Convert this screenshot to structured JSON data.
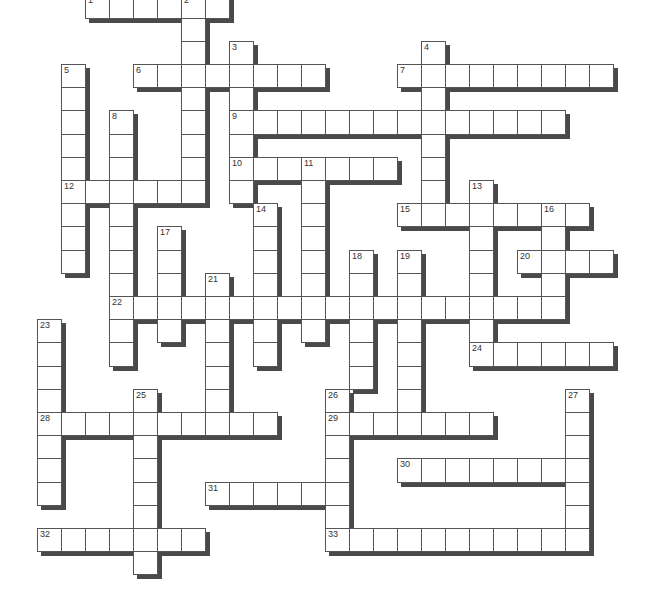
{
  "puzzle": {
    "type": "crossword",
    "layout": {
      "origin_x": 37,
      "origin_y": -5.6,
      "cell_w": 24,
      "cell_h": 23.2,
      "shadow_offset": 4
    },
    "colors": {
      "cell_bg": "#ffffff",
      "cell_border": "#555555",
      "shadow": "#4a4a4a",
      "number": "#333333"
    },
    "entries": [
      {
        "number": "1",
        "direction": "across",
        "row": 0,
        "col": 2,
        "length": 6
      },
      {
        "number": "2",
        "direction": "down",
        "row": 0,
        "col": 6,
        "length": 9
      },
      {
        "number": "3",
        "direction": "down",
        "row": 2,
        "col": 8,
        "length": 7
      },
      {
        "number": "4",
        "direction": "down",
        "row": 2,
        "col": 16,
        "length": 8
      },
      {
        "number": "5",
        "direction": "down",
        "row": 3,
        "col": 1,
        "length": 9
      },
      {
        "number": "6",
        "direction": "across",
        "row": 3,
        "col": 4,
        "length": 8
      },
      {
        "number": "7",
        "direction": "across",
        "row": 3,
        "col": 15,
        "length": 9
      },
      {
        "number": "8",
        "direction": "down",
        "row": 5,
        "col": 3,
        "length": 11
      },
      {
        "number": "9",
        "direction": "across",
        "row": 5,
        "col": 8,
        "length": 14
      },
      {
        "number": "10",
        "direction": "across",
        "row": 7,
        "col": 8,
        "length": 7
      },
      {
        "number": "11",
        "direction": "down",
        "row": 7,
        "col": 11,
        "length": 8
      },
      {
        "number": "12",
        "direction": "across",
        "row": 8,
        "col": 1,
        "length": 6
      },
      {
        "number": "13",
        "direction": "down",
        "row": 8,
        "col": 18,
        "length": 8
      },
      {
        "number": "14",
        "direction": "down",
        "row": 9,
        "col": 9,
        "length": 7
      },
      {
        "number": "15",
        "direction": "across",
        "row": 9,
        "col": 15,
        "length": 8
      },
      {
        "number": "16",
        "direction": "down",
        "row": 9,
        "col": 21,
        "length": 5
      },
      {
        "number": "17",
        "direction": "down",
        "row": 10,
        "col": 5,
        "length": 5
      },
      {
        "number": "18",
        "direction": "down",
        "row": 11,
        "col": 13,
        "length": 6
      },
      {
        "number": "19",
        "direction": "down",
        "row": 11,
        "col": 15,
        "length": 8
      },
      {
        "number": "20",
        "direction": "across",
        "row": 11,
        "col": 20,
        "length": 4
      },
      {
        "number": "21",
        "direction": "down",
        "row": 12,
        "col": 7,
        "length": 7
      },
      {
        "number": "22",
        "direction": "across",
        "row": 13,
        "col": 3,
        "length": 19
      },
      {
        "number": "23",
        "direction": "down",
        "row": 14,
        "col": 0,
        "length": 8
      },
      {
        "number": "24",
        "direction": "across",
        "row": 15,
        "col": 18,
        "length": 6
      },
      {
        "number": "25",
        "direction": "down",
        "row": 17,
        "col": 4,
        "length": 8
      },
      {
        "number": "26",
        "direction": "down",
        "row": 17,
        "col": 12,
        "length": 7
      },
      {
        "number": "27",
        "direction": "down",
        "row": 17,
        "col": 22,
        "length": 7
      },
      {
        "number": "28",
        "direction": "across",
        "row": 18,
        "col": 0,
        "length": 10
      },
      {
        "number": "29",
        "direction": "across",
        "row": 18,
        "col": 12,
        "length": 7
      },
      {
        "number": "30",
        "direction": "across",
        "row": 20,
        "col": 15,
        "length": 8
      },
      {
        "number": "31",
        "direction": "across",
        "row": 21,
        "col": 7,
        "length": 6
      },
      {
        "number": "32",
        "direction": "across",
        "row": 23,
        "col": 0,
        "length": 7
      },
      {
        "number": "33",
        "direction": "across",
        "row": 23,
        "col": 12,
        "length": 11
      }
    ]
  }
}
